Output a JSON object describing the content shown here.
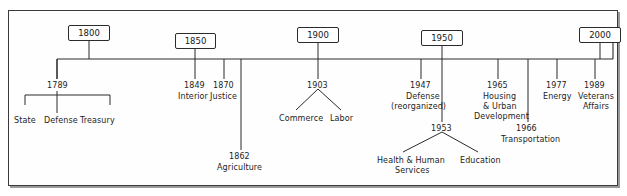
{
  "diagram": {
    "frame": {
      "stroke": "#3a3a3a",
      "background": "#ffffff"
    },
    "axis": {
      "label": "timeline-axis",
      "start_year": 1789,
      "end_year": 2000,
      "stroke": "#2b2b2b"
    },
    "era_markers": [
      {
        "id": "era-1800",
        "label": "1800",
        "x": 68,
        "y": 25,
        "w": 42,
        "tick_x": 89,
        "stem_top": 41
      },
      {
        "id": "era-1850",
        "label": "1850",
        "x": 175,
        "y": 33,
        "w": 41,
        "tick_x": 195,
        "stem_top": 49
      },
      {
        "id": "era-1900",
        "label": "1900",
        "x": 297,
        "y": 27,
        "w": 42,
        "tick_x": 318,
        "stem_top": 43
      },
      {
        "id": "era-1950",
        "label": "1950",
        "x": 421,
        "y": 30,
        "w": 42,
        "tick_x": 442,
        "stem_top": 46
      },
      {
        "id": "era-2000",
        "label": "2000",
        "x": 579,
        "y": 27,
        "w": 42,
        "tick_x": 600,
        "stem_top": 43
      }
    ],
    "events": [
      {
        "id": "event-1789",
        "year": "1789",
        "year_x": 47,
        "year_y": 81,
        "tick_x": 57,
        "tick_bottom": 79,
        "branch_style": "bracket",
        "bracket": {
          "y": 95,
          "left": 25,
          "right": 110,
          "stem_bottom": 105
        },
        "children": [
          {
            "label": "State",
            "x": 14,
            "y": 116,
            "drop_x": 25
          },
          {
            "label": "Defense",
            "x": 44,
            "y": 116,
            "drop_x": 57
          },
          {
            "label": "Treasury",
            "x": 80,
            "y": 116,
            "drop_x": 110
          }
        ]
      },
      {
        "id": "event-1849",
        "year": "1849",
        "year_x": 184,
        "year_y": 81,
        "tick_x": 195,
        "tick_bottom": 79,
        "branch_style": "none",
        "children": [
          {
            "label": "Interior",
            "x": 178,
            "y": 92
          }
        ]
      },
      {
        "id": "event-1870",
        "year": "1870",
        "year_x": 213,
        "year_y": 81,
        "tick_x": 224,
        "tick_bottom": 79,
        "branch_style": "none",
        "children": [
          {
            "label": "Justice",
            "x": 210,
            "y": 92
          }
        ]
      },
      {
        "id": "event-1862",
        "year": "1862",
        "year_x": 229,
        "year_y": 152,
        "tick_x": 241,
        "tick_bottom": 150,
        "branch_style": "none",
        "children": [
          {
            "label": "Agriculture",
            "x": 217,
            "y": 163
          }
        ]
      },
      {
        "id": "event-1903",
        "year": "1903",
        "year_x": 307,
        "year_y": 81,
        "tick_x": 318,
        "tick_bottom": 79,
        "branch_style": "vee",
        "vee": {
          "apex_y": 89,
          "left_x": 296,
          "right_x": 341,
          "bottom_y": 110
        },
        "children": [
          {
            "label": "Commerce",
            "x": 279,
            "y": 114
          },
          {
            "label": "Labor",
            "x": 330,
            "y": 114
          }
        ]
      },
      {
        "id": "event-1947",
        "year": "1947",
        "year_x": 410,
        "year_y": 81,
        "tick_x": 421,
        "tick_bottom": 79,
        "branch_style": "none",
        "children": [
          {
            "label": "Defense",
            "x": 406,
            "y": 92
          },
          {
            "label": "(reorganized)",
            "x": 391,
            "y": 102
          }
        ]
      },
      {
        "id": "event-1953",
        "year": "1953",
        "year_x": 431,
        "year_y": 124,
        "tick_x": 442,
        "tick_bottom": 122,
        "branch_style": "vee",
        "vee": {
          "apex_y": 132,
          "left_x": 403,
          "right_x": 478,
          "bottom_y": 152
        },
        "children": [
          {
            "label": "Health & Human",
            "x": 377,
            "y": 156
          },
          {
            "label": "Services",
            "x": 395,
            "y": 166
          },
          {
            "label": "Education",
            "x": 460,
            "y": 156
          }
        ]
      },
      {
        "id": "event-1965",
        "year": "1965",
        "year_x": 487,
        "year_y": 81,
        "tick_x": 498,
        "tick_bottom": 79,
        "branch_style": "none",
        "children": [
          {
            "label": "Housing",
            "x": 483,
            "y": 92
          },
          {
            "label": "& Urban",
            "x": 483,
            "y": 102
          },
          {
            "label": "Development",
            "x": 474,
            "y": 112
          }
        ]
      },
      {
        "id": "event-1966",
        "year": "1966",
        "year_x": 516,
        "year_y": 124,
        "tick_x": 528,
        "tick_bottom": 122,
        "branch_style": "none",
        "children": [
          {
            "label": "Transportation",
            "x": 501,
            "y": 135
          }
        ]
      },
      {
        "id": "event-1977",
        "year": "1977",
        "year_x": 546,
        "year_y": 81,
        "tick_x": 557,
        "tick_bottom": 79,
        "branch_style": "none",
        "children": [
          {
            "label": "Energy",
            "x": 543,
            "y": 92
          }
        ]
      },
      {
        "id": "event-1989",
        "year": "1989",
        "year_x": 584,
        "year_y": 81,
        "tick_x": 595,
        "tick_bottom": 79,
        "branch_style": "none",
        "children": [
          {
            "label": "Veterans",
            "x": 578,
            "y": 92
          },
          {
            "label": "Affairs",
            "x": 583,
            "y": 102
          }
        ]
      }
    ]
  }
}
